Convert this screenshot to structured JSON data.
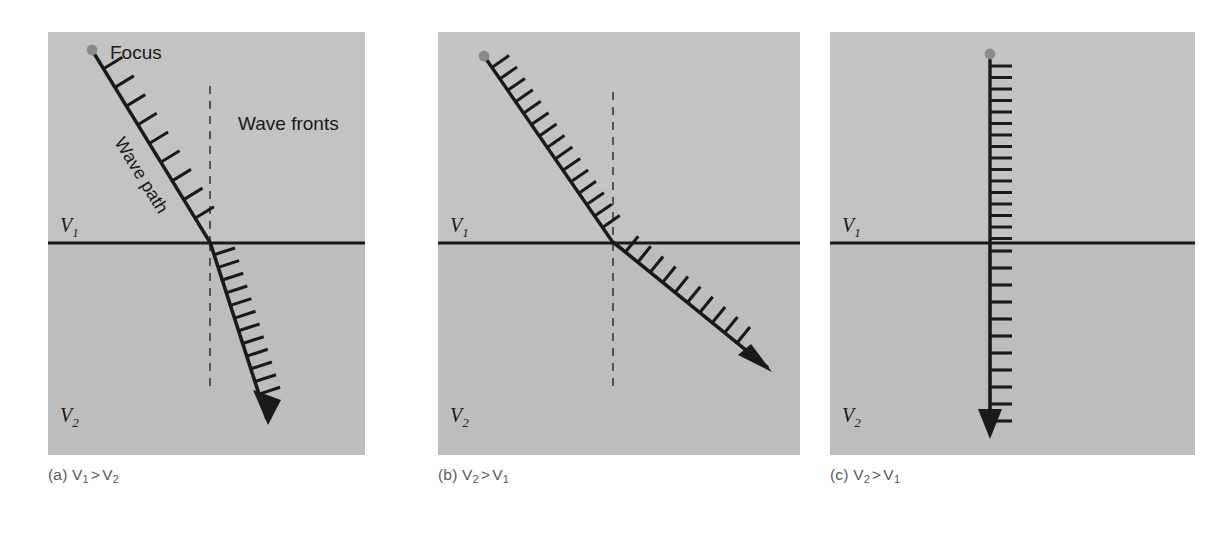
{
  "figure": {
    "background_color": "#ffffff",
    "upper_layer_color": "#c3c3c3",
    "lower_layer_color": "#bdbdbd",
    "line_color": "#1a1a1a",
    "focus_dot_color": "#8a8a8a",
    "caption_color": "#58595b",
    "label_color": "#1a1a1a"
  },
  "panels": [
    {
      "id": "a",
      "caption_prefix": "(a)",
      "caption_left": "V",
      "caption_left_sub": "1",
      "caption_operator": ">",
      "caption_right": "V",
      "caption_right_sub": "2",
      "caption_text": "(a) V1 > V2",
      "upper_velocity_label": "V",
      "upper_velocity_sub": "1",
      "lower_velocity_label": "V",
      "lower_velocity_sub": "2",
      "focus_label": "Focus",
      "wave_path_label": "Wave path",
      "wave_fronts_label": "Wave fronts",
      "has_focus_label": true,
      "has_wave_path_label": true,
      "has_wave_fronts_label": true,
      "has_normal_line": true,
      "incident_ray": {
        "x1": 44,
        "y1": 18,
        "x2": 162,
        "y2": 211
      },
      "refracted_ray": {
        "x1": 162,
        "y1": 211,
        "x2": 218,
        "y2": 385
      },
      "incident_tick_count": 9,
      "refracted_tick_count": 13,
      "incident_tick_spacing_desc": "wide spacing in fast layer V1",
      "refracted_tick_spacing_desc": "narrow spacing in slow layer V2",
      "bending_description": "ray bends toward the normal entering slower layer"
    },
    {
      "id": "b",
      "caption_prefix": "(b)",
      "caption_left": "V",
      "caption_left_sub": "2",
      "caption_operator": ">",
      "caption_right": "V",
      "caption_right_sub": "1",
      "caption_text": "(b) V2 > V1",
      "upper_velocity_label": "V",
      "upper_velocity_sub": "1",
      "lower_velocity_label": "V",
      "lower_velocity_sub": "2",
      "has_focus_label": false,
      "has_wave_path_label": false,
      "has_wave_fronts_label": false,
      "has_normal_line": true,
      "incident_ray": {
        "x1": 46,
        "y1": 24,
        "x2": 175,
        "y2": 211
      },
      "refracted_ray": {
        "x1": 175,
        "y1": 211,
        "x2": 327,
        "y2": 333
      },
      "incident_tick_count": 16,
      "refracted_tick_count": 10,
      "incident_tick_spacing_desc": "narrow spacing in slow layer V1",
      "refracted_tick_spacing_desc": "wide spacing in fast layer V2",
      "bending_description": "ray bends away from the normal entering faster layer"
    },
    {
      "id": "c",
      "caption_prefix": "(c)",
      "caption_left": "V",
      "caption_left_sub": "2",
      "caption_operator": ">",
      "caption_right": "V",
      "caption_right_sub": "1",
      "caption_text": "(c) V2 > V1",
      "upper_velocity_label": "V",
      "upper_velocity_sub": "1",
      "lower_velocity_label": "V",
      "lower_velocity_sub": "2",
      "has_focus_label": false,
      "has_wave_path_label": false,
      "has_wave_fronts_label": false,
      "has_normal_line": false,
      "incident_ray": {
        "x1": 160,
        "y1": 22,
        "x2": 160,
        "y2": 211
      },
      "refracted_ray": {
        "x1": 160,
        "y1": 211,
        "x2": 160,
        "y2": 396
      },
      "incident_tick_count": 16,
      "refracted_tick_count": 11,
      "incident_tick_spacing_desc": "narrow spacing in slow layer V1",
      "refracted_tick_spacing_desc": "wide spacing in fast layer V2",
      "bending_description": "normal incidence, no bending"
    }
  ],
  "geometry": {
    "panel_width": 317,
    "panel_height": 423,
    "interface_y": 211,
    "panel_a_left": 48,
    "panel_b_left": 438,
    "panel_c_left": 830,
    "panel_top": 32,
    "caption_y": 466
  }
}
